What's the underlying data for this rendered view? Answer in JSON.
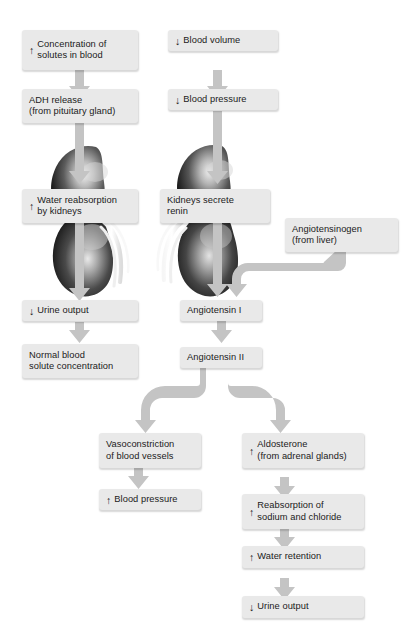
{
  "diagram": {
    "type": "flowchart",
    "colors": {
      "box_fill": "#e9e9e9",
      "text": "#1b1b1b",
      "arrow": "#c4c4c4",
      "kidney_dark": "#2a2a2a",
      "kidney_light": "#dcdcdc",
      "background": "#ffffff"
    },
    "arrow_glyphs": {
      "increase": "↑",
      "decrease": "↓"
    },
    "illustrations": [
      {
        "name": "kidney-left",
        "label": "kidney organ illustration"
      },
      {
        "name": "kidney-right",
        "label": "kidney organ illustration"
      }
    ],
    "nodes": [
      {
        "id": "concentration-solutes",
        "arrow": "↑",
        "text": "Concentration of\nsolutes in blood"
      },
      {
        "id": "blood-volume",
        "arrow": "↓",
        "text": "Blood volume"
      },
      {
        "id": "adh-release",
        "arrow": "",
        "text": "ADH release\n(from pituitary gland)"
      },
      {
        "id": "blood-pressure-down",
        "arrow": "↓",
        "text": "Blood pressure"
      },
      {
        "id": "water-reabsorption",
        "arrow": "↑",
        "text": "Water reabsorption\nby kidneys"
      },
      {
        "id": "kidneys-secrete-renin",
        "arrow": "",
        "text": "Kidneys secrete\nrenin"
      },
      {
        "id": "angiotensinogen",
        "arrow": "",
        "text": "Angiotensinogen\n(from liver)"
      },
      {
        "id": "urine-output-down",
        "arrow": "↓",
        "text": "Urine output"
      },
      {
        "id": "angiotensin-i",
        "arrow": "",
        "text": "Angiotensin I"
      },
      {
        "id": "normal-blood-solute",
        "arrow": "",
        "text": "Normal blood\nsolute concentration"
      },
      {
        "id": "angiotensin-ii",
        "arrow": "",
        "text": "Angiotensin II"
      },
      {
        "id": "vasoconstriction",
        "arrow": "",
        "text": "Vasoconstriction\nof blood vessels"
      },
      {
        "id": "aldosterone",
        "arrow": "↑",
        "text": "Aldosterone\n(from adrenal glands)"
      },
      {
        "id": "blood-pressure-up",
        "arrow": "↑",
        "text": "Blood pressure"
      },
      {
        "id": "reabsorption-sodium",
        "arrow": "↑",
        "text": "Reabsorption of\nsodium and chloride"
      },
      {
        "id": "water-retention",
        "arrow": "↑",
        "text": "Water retention"
      },
      {
        "id": "urine-output-down-2",
        "arrow": "↓",
        "text": "Urine output"
      }
    ]
  }
}
